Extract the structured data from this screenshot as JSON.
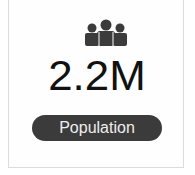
{
  "stat_card": {
    "icon": "people-group-icon",
    "value": "2.2M",
    "label": "Population",
    "colors": {
      "icon": "#3b3b3b",
      "value": "#111111",
      "pill_background": "#3b3b3b",
      "pill_text": "#eeeeee",
      "border": "#dcdcdc"
    }
  }
}
